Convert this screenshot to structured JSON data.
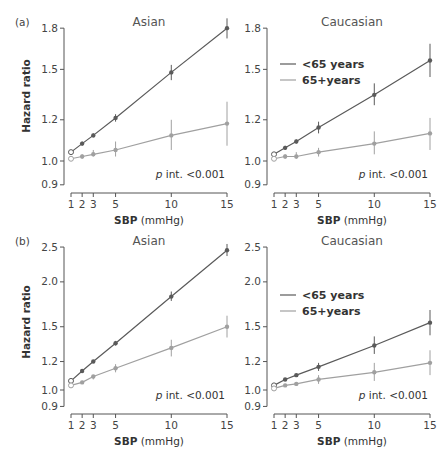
{
  "figure": {
    "rows": [
      {
        "tag": "(a)"
      },
      {
        "tag": "(b)"
      }
    ]
  },
  "colors": {
    "under65": "#5a5a5a",
    "over65": "#a0a0a0",
    "axis": "#555555"
  },
  "chart_data": [
    {
      "type": "line",
      "panel": "(a)",
      "title": "Asian",
      "xlabel": "SBP (mmHg)",
      "ylabel": "Hazard ratio",
      "yscale": "log",
      "xticks": [
        1,
        2,
        3,
        5,
        10,
        15
      ],
      "yticks": [
        0.9,
        1.0,
        1.2,
        1.5,
        1.8
      ],
      "ylim": [
        0.9,
        1.8
      ],
      "annotation": "p int. <0.001",
      "x": [
        1,
        2,
        3,
        5,
        10,
        15
      ],
      "series": [
        {
          "name": "<65 years",
          "values": [
            1.04,
            1.08,
            1.12,
            1.21,
            1.48,
            1.8
          ],
          "lower": [
            1.04,
            1.07,
            1.11,
            1.19,
            1.43,
            1.72
          ],
          "upper": [
            1.04,
            1.09,
            1.13,
            1.23,
            1.53,
            1.88
          ]
        },
        {
          "name": "65+years",
          "values": [
            1.01,
            1.02,
            1.03,
            1.05,
            1.12,
            1.18
          ],
          "lower": [
            1.01,
            1.01,
            1.02,
            1.02,
            1.05,
            1.07
          ],
          "upper": [
            1.01,
            1.03,
            1.05,
            1.09,
            1.2,
            1.3
          ]
        }
      ],
      "legend": false
    },
    {
      "type": "line",
      "panel": "(a)",
      "title": "Caucasian",
      "xlabel": "SBP (mmHg)",
      "ylabel": "",
      "yscale": "log",
      "xticks": [
        1,
        2,
        3,
        5,
        10,
        15
      ],
      "yticks": [
        0.9,
        1.0,
        1.2,
        1.5,
        1.8
      ],
      "ylim": [
        0.9,
        1.8
      ],
      "annotation": "p int. <0.001",
      "x": [
        1,
        2,
        3,
        5,
        10,
        15
      ],
      "series": [
        {
          "name": "<65 years",
          "values": [
            1.03,
            1.06,
            1.09,
            1.16,
            1.34,
            1.56
          ],
          "lower": [
            1.03,
            1.05,
            1.08,
            1.13,
            1.28,
            1.45
          ],
          "upper": [
            1.03,
            1.07,
            1.1,
            1.19,
            1.41,
            1.68
          ]
        },
        {
          "name": "65+years",
          "values": [
            1.01,
            1.02,
            1.02,
            1.04,
            1.08,
            1.13
          ],
          "lower": [
            1.01,
            1.01,
            1.01,
            1.02,
            1.03,
            1.05
          ],
          "upper": [
            1.01,
            1.03,
            1.04,
            1.06,
            1.14,
            1.21
          ]
        }
      ],
      "legend": true,
      "legend_items": [
        "<65 years",
        "65+years"
      ]
    },
    {
      "type": "line",
      "panel": "(b)",
      "title": "Asian",
      "xlabel": "SBP (mmHg)",
      "ylabel": "Hazard ratio",
      "yscale": "log",
      "xticks": [
        1,
        2,
        3,
        5,
        10,
        15
      ],
      "yticks": [
        0.9,
        1.0,
        1.2,
        1.5,
        2.0,
        2.5
      ],
      "ylim": [
        0.9,
        2.5
      ],
      "annotation": "p int. <0.001",
      "x": [
        1,
        2,
        3,
        5,
        10,
        15
      ],
      "series": [
        {
          "name": "<65 years",
          "values": [
            1.06,
            1.13,
            1.2,
            1.35,
            1.82,
            2.45
          ],
          "lower": [
            1.06,
            1.12,
            1.19,
            1.33,
            1.77,
            2.36
          ],
          "upper": [
            1.06,
            1.14,
            1.21,
            1.37,
            1.88,
            2.55
          ]
        },
        {
          "name": "65+years",
          "values": [
            1.03,
            1.05,
            1.09,
            1.15,
            1.31,
            1.5
          ],
          "lower": [
            1.03,
            1.04,
            1.07,
            1.12,
            1.24,
            1.4
          ],
          "upper": [
            1.03,
            1.06,
            1.1,
            1.18,
            1.38,
            1.61
          ]
        }
      ],
      "legend": false
    },
    {
      "type": "line",
      "panel": "(b)",
      "title": "Caucasian",
      "xlabel": "SBP (mmHg)",
      "ylabel": "",
      "yscale": "log",
      "xticks": [
        1,
        2,
        3,
        5,
        10,
        15
      ],
      "yticks": [
        0.9,
        1.0,
        1.2,
        1.5,
        2.0,
        2.5
      ],
      "ylim": [
        0.9,
        2.5
      ],
      "annotation": "p int. <0.001",
      "x": [
        1,
        2,
        3,
        5,
        10,
        15
      ],
      "series": [
        {
          "name": "<65 years",
          "values": [
            1.03,
            1.07,
            1.1,
            1.16,
            1.33,
            1.54
          ],
          "lower": [
            1.03,
            1.06,
            1.09,
            1.13,
            1.26,
            1.42
          ],
          "upper": [
            1.03,
            1.08,
            1.11,
            1.19,
            1.41,
            1.67
          ]
        },
        {
          "name": "65+years",
          "values": [
            1.01,
            1.03,
            1.04,
            1.07,
            1.12,
            1.19
          ],
          "lower": [
            1.01,
            1.02,
            1.03,
            1.04,
            1.06,
            1.1
          ],
          "upper": [
            1.01,
            1.04,
            1.05,
            1.1,
            1.19,
            1.29
          ]
        }
      ],
      "legend": true,
      "legend_items": [
        "<65 years",
        "65+years"
      ]
    }
  ]
}
